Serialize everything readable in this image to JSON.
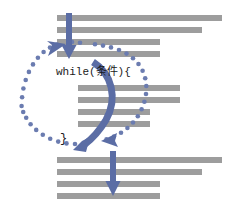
{
  "diagram": {
    "colors": {
      "code_bar": "#9d9d9d",
      "arrow_blue": "#5b6da5",
      "dotted_blue": "#6b7cb0",
      "background": "#ffffff",
      "text": "#1a1a1a"
    },
    "labels": {
      "loop_header": "while(条件){",
      "loop_close": "}"
    },
    "code_blocks": {
      "before": {
        "name": "code-before-loop",
        "bars": [
          {
            "x": 57,
            "y": 15,
            "width": 165,
            "height": 6
          },
          {
            "x": 57,
            "y": 27,
            "width": 145,
            "height": 6
          },
          {
            "x": 57,
            "y": 39,
            "width": 103,
            "height": 6
          },
          {
            "x": 57,
            "y": 51,
            "width": 103,
            "height": 6
          }
        ]
      },
      "body": {
        "name": "code-loop-body",
        "bars": [
          {
            "x": 78,
            "y": 85,
            "width": 102,
            "height": 6
          },
          {
            "x": 78,
            "y": 97,
            "width": 102,
            "height": 6
          },
          {
            "x": 78,
            "y": 109,
            "width": 72,
            "height": 6
          },
          {
            "x": 78,
            "y": 121,
            "width": 72,
            "height": 6
          }
        ]
      },
      "after": {
        "name": "code-after-loop",
        "bars": [
          {
            "x": 57,
            "y": 157,
            "width": 165,
            "height": 6
          },
          {
            "x": 57,
            "y": 169,
            "width": 145,
            "height": 6
          },
          {
            "x": 57,
            "y": 181,
            "width": 103,
            "height": 6
          },
          {
            "x": 57,
            "y": 193,
            "width": 103,
            "height": 6
          }
        ]
      }
    },
    "arrows": {
      "entry": {
        "name": "entry-down-arrow",
        "x": 69,
        "y_start": 14,
        "y_end": 58,
        "stroke_width": 6,
        "head_width": 15,
        "head_height": 13
      },
      "exit": {
        "name": "exit-down-arrow",
        "x": 113,
        "y_start": 152,
        "y_end": 198,
        "stroke_width": 6,
        "head_width": 15,
        "head_height": 13
      },
      "loop_body_curve": {
        "name": "loop-body-curved-arrow",
        "description": "thick curved arrow from loop header down to loop end"
      },
      "loop_back": {
        "name": "loop-back-dotted-ellipse",
        "description": "dotted ellipse returning from loop end back to condition",
        "dot_radius": 2.3,
        "dot_count": 34
      }
    }
  }
}
